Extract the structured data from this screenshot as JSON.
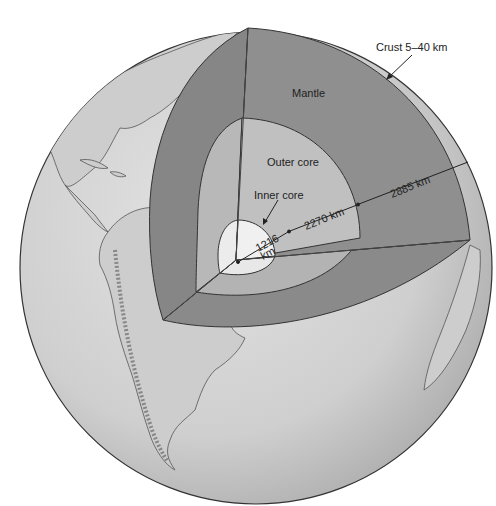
{
  "diagram": {
    "labels": {
      "crust": "Crust 5–40 km",
      "mantle": "Mantle",
      "outer_core": "Outer core",
      "inner_core": "Inner core",
      "inner_core_radius_value": "1216",
      "inner_core_radius_unit": "km",
      "outer_core_thickness": "2270 km",
      "mantle_thickness": "2885 km"
    },
    "colors": {
      "background": "#ffffff",
      "globe_surface": "#d4d4d4",
      "crust_mantle_face_front": "#8f8f8f",
      "mantle_face_left": "#868686",
      "mantle_face_bottom": "#8a8a8a",
      "outer_core": "#bdbdbd",
      "outer_core_bottom": "#b3b3b3",
      "inner_core": "#eeeeee",
      "outline": "#333333",
      "land_outline": "#555555"
    }
  }
}
